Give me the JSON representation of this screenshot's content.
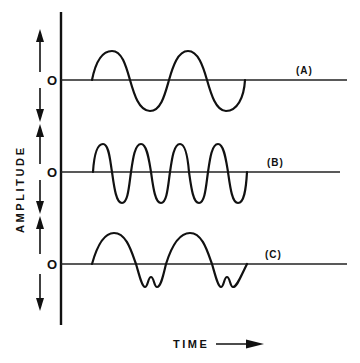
{
  "diagram": {
    "y_axis_label": "AMPLITUDE",
    "x_axis_label": "TIME",
    "zero_marker": "O",
    "colors": {
      "ink": "#111111",
      "background": "#ffffff"
    },
    "traces": [
      {
        "id": "A",
        "label": "(A)",
        "description": "Sine wave, 2 cycles",
        "cycles": 2,
        "baseline_y": 80
      },
      {
        "id": "B",
        "label": "(B)",
        "description": "Sine wave, 4 cycles (double frequency)",
        "cycles": 4,
        "baseline_y": 172
      },
      {
        "id": "C",
        "label": "(C)",
        "description": "Distorted wave, 2 cycles with notched (double-dip) negative troughs",
        "cycles": 2,
        "baseline_y": 264
      }
    ]
  }
}
